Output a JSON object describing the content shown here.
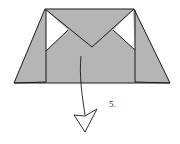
{
  "diagram": {
    "type": "origami-fold-step",
    "step_label": "5.",
    "colors": {
      "paper": "#b5b5b5",
      "stroke": "#1a1a1a",
      "background": "#ffffff"
    },
    "arrow": "fold-down-arrow"
  }
}
